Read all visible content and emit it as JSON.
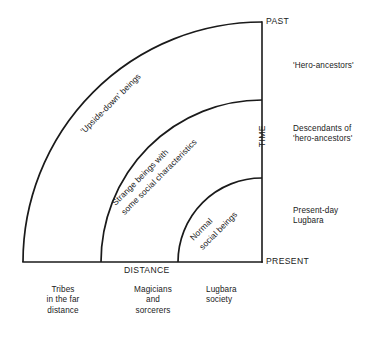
{
  "diagram": {
    "type": "quarter-circle-concentric-band-diagram",
    "axes": {
      "vertical": {
        "name": "TIME",
        "label": "TIME",
        "top_cap": "PAST",
        "bottom_cap": "PRESENT"
      },
      "horizontal": {
        "name": "DISTANCE",
        "label": "DISTANCE"
      }
    },
    "geometry": {
      "origin_x": 262,
      "origin_y": 262,
      "radii": [
        84,
        162,
        240
      ],
      "axis_top_y": 22,
      "axis_left_x": 23
    },
    "bands": [
      {
        "index": 0,
        "arc_label": "Normal\nsocial beings",
        "time_label": "Present-day\nLugbara",
        "distance_label": "Lugbara\nsociety",
        "radius": 84
      },
      {
        "index": 1,
        "arc_label": "Strange beings with\nsome social characteristics",
        "time_label": "Descendants of\n'hero-ancestors'",
        "distance_label": "Magicians\nand\nsorcerers",
        "radius": 162
      },
      {
        "index": 2,
        "arc_label": "'Upside-down' beings",
        "time_label": "'Hero-ancestors'",
        "distance_label": "Tribes\nin the far\ndistance",
        "radius": 240
      }
    ],
    "colors": {
      "stroke": "#1a1a1a",
      "background": "#ffffff",
      "text": "#1a1a1a"
    }
  }
}
